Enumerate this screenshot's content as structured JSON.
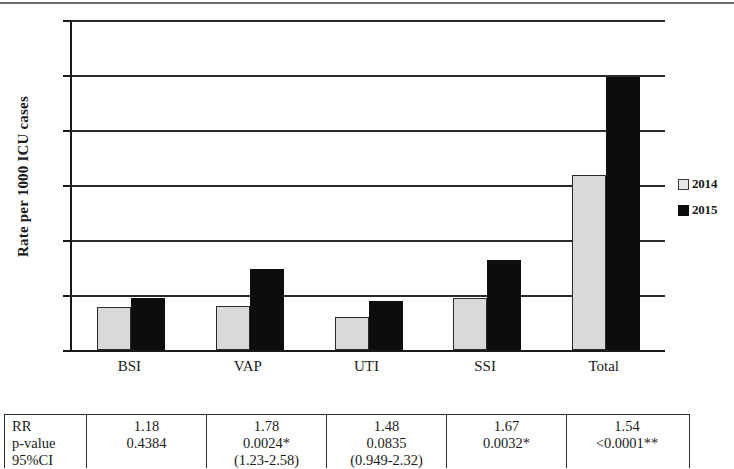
{
  "chart_data": {
    "type": "bar",
    "title": "",
    "xlabel": "",
    "ylabel": "Rate per 1000 ICU cases",
    "categories": [
      "BSI",
      "VAP",
      "UTI",
      "SSI",
      "Total"
    ],
    "series": [
      {
        "name": "2014",
        "values": [
          39,
          40,
          30,
          47,
          159
        ],
        "color": "#d9d9d9"
      },
      {
        "name": "2015",
        "values": [
          47,
          74,
          45,
          82,
          248
        ],
        "color": "#0d0d0d"
      }
    ],
    "ylim": [
      0,
      300
    ],
    "yticks": [
      0,
      50,
      100,
      150,
      200,
      250,
      300
    ],
    "ytick_labels": [
      "0",
      "50",
      "100",
      "150",
      "200",
      "250",
      "300"
    ],
    "grid": true,
    "legend_position": "right",
    "legend": [
      "2014",
      "2015"
    ]
  },
  "legend": {
    "items": [
      {
        "label": "2014",
        "swatch": "light-square-swatch"
      },
      {
        "label": "2015",
        "swatch": "black-square-swatch"
      }
    ]
  },
  "stats_table": {
    "row_labels": [
      "RR",
      "p-value",
      "95%CI"
    ],
    "columns": [
      {
        "category": "BSI",
        "rr": "1.18",
        "p_value": "0.4384",
        "ci": ""
      },
      {
        "category": "VAP",
        "rr": "1.78",
        "p_value": "0.0024*",
        "ci": "(1.23-2.58)"
      },
      {
        "category": "UTI",
        "rr": "1.48",
        "p_value": "0.0835",
        "ci": "(0.949-2.32)"
      },
      {
        "category": "SSI",
        "rr": "1.67",
        "p_value": "0.0032*",
        "ci": ""
      },
      {
        "category": "Total",
        "rr": "1.54",
        "p_value": "<0.0001**",
        "ci": ""
      }
    ]
  }
}
